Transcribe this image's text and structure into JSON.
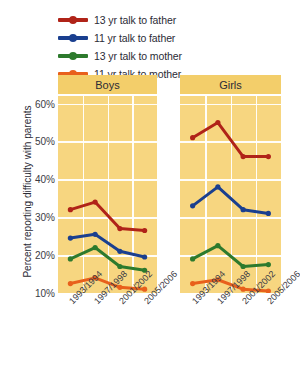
{
  "chart_data": {
    "type": "line",
    "title": "",
    "xlabel": "",
    "ylabel": "Percent reporting difficulty with parents",
    "ylim": [
      10,
      60
    ],
    "ytick_labels": [
      "60%",
      "50%",
      "40%",
      "30%",
      "20%",
      "10%"
    ],
    "ytick_values": [
      60,
      50,
      40,
      30,
      20,
      10
    ],
    "grid": true,
    "legend_position": "top-left",
    "categories": [
      "1993/1994",
      "1997/1998",
      "2001/2002",
      "2005/2006"
    ],
    "panels": [
      {
        "label": "Boys",
        "series": [
          {
            "name": "13 yr talk to father",
            "color": "#b02318",
            "values": [
              32,
              34,
              27,
              26.5
            ]
          },
          {
            "name": "11 yr talk to father",
            "color": "#1a3f8f",
            "values": [
              24.5,
              25.5,
              21,
              19.5
            ]
          },
          {
            "name": "13 yr talk to mother",
            "color": "#2d7a2d",
            "values": [
              19,
              22,
              17,
              16
            ]
          },
          {
            "name": "11 yr talk to mother",
            "color": "#e8601c",
            "values": [
              12.5,
              14,
              11.5,
              11
            ]
          }
        ]
      },
      {
        "label": "Girls",
        "series": [
          {
            "name": "13 yr talk to father",
            "color": "#b02318",
            "values": [
              51,
              55,
              46,
              46
            ]
          },
          {
            "name": "11 yr talk to father",
            "color": "#1a3f8f",
            "values": [
              33,
              38,
              32,
              31
            ]
          },
          {
            "name": "13 yr talk to mother",
            "color": "#2d7a2d",
            "values": [
              19,
              22.5,
              17,
              17.5
            ]
          },
          {
            "name": "11 yr talk to mother",
            "color": "#e8601c",
            "values": [
              12.5,
              13.5,
              11,
              10.5
            ]
          }
        ]
      }
    ],
    "legend": [
      {
        "label": "13 yr talk to father",
        "color": "#b02318"
      },
      {
        "label": "11 yr talk to father",
        "color": "#1a3f8f"
      },
      {
        "label": "13 yr talk to mother",
        "color": "#2d7a2d"
      },
      {
        "label": "11 yr talk to mother",
        "color": "#e8601c"
      }
    ],
    "colors": {
      "plot_background": "#f7d680",
      "header_background": "#f3ce6a",
      "gridline": "#ffffff",
      "page_background": "#ffffff"
    }
  }
}
